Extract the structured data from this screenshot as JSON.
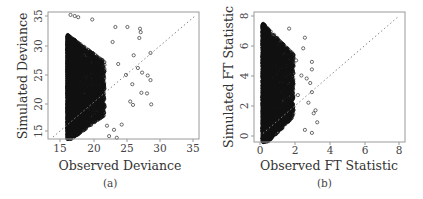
{
  "chart_data": [
    {
      "type": "scatter",
      "panel": "(a)",
      "title": "",
      "xlabel": "Observed Deviance",
      "ylabel": "Simulated Deviance",
      "xlim": [
        14,
        35.5
      ],
      "ylim": [
        13.5,
        35.5
      ],
      "xticks": [
        15,
        20,
        25,
        30,
        35
      ],
      "yticks": [
        15,
        20,
        25,
        30,
        35
      ],
      "grid": false,
      "reference_line": "y = x (dotted)",
      "marker": "open circle",
      "description": "Dense cloud starting at observed ≈16.8, spanning simulated ≈14–33; sparse points extend to observed ≈29",
      "points_sample": [
        [
          17.2,
          35.0
        ],
        [
          17.8,
          34.8
        ],
        [
          18.3,
          34.6
        ],
        [
          20.3,
          34.2
        ],
        [
          23.6,
          32.9
        ],
        [
          25.3,
          32.9
        ],
        [
          27.1,
          32.6
        ],
        [
          27.2,
          32.0
        ],
        [
          27.0,
          31.0
        ],
        [
          23.2,
          30.3
        ],
        [
          26.2,
          28.0
        ],
        [
          28.6,
          28.4
        ],
        [
          24.0,
          26.5
        ],
        [
          26.8,
          25.8
        ],
        [
          27.4,
          25.0
        ],
        [
          28.2,
          24.5
        ],
        [
          28.6,
          23.7
        ],
        [
          25.1,
          24.6
        ],
        [
          26.0,
          23.0
        ],
        [
          27.3,
          21.5
        ],
        [
          28.1,
          21.4
        ],
        [
          28.7,
          19.5
        ],
        [
          26.1,
          19.4
        ],
        [
          25.7,
          20.0
        ],
        [
          24.5,
          16.0
        ],
        [
          23.4,
          15.1
        ],
        [
          22.7,
          14.0
        ],
        [
          23.8,
          13.7
        ],
        [
          22.4,
          15.8
        ],
        [
          21.6,
          17.5
        ]
      ],
      "dense_region": {
        "x_range": [
          16.8,
          21.0
        ],
        "y_range": [
          14.5,
          33.0
        ]
      }
    },
    {
      "type": "scatter",
      "panel": "(b)",
      "title": "",
      "xlabel": "Observed FT Statistic",
      "ylabel": "Simulated FT Statistic",
      "xlim": [
        -0.3,
        8.3
      ],
      "ylim": [
        -0.3,
        8.3
      ],
      "xticks": [
        0,
        2,
        4,
        6,
        8
      ],
      "yticks": [
        0,
        2,
        4,
        6,
        8
      ],
      "grid": false,
      "reference_line": "y = x (dotted)",
      "marker": "open circle",
      "description": "Dense cloud starting at observed ≈0.2, spanning simulated 0–8.3; sparse points extend to observed ≈3.3",
      "points_sample": [
        [
          1.7,
          7.2
        ],
        [
          2.6,
          6.6
        ],
        [
          2.5,
          5.9
        ],
        [
          2.1,
          5.1
        ],
        [
          3.0,
          5.0
        ],
        [
          3.0,
          4.5
        ],
        [
          2.4,
          4.1
        ],
        [
          2.7,
          3.9
        ],
        [
          2.9,
          3.6
        ],
        [
          3.0,
          3.0
        ],
        [
          3.2,
          1.8
        ],
        [
          3.1,
          1.6
        ],
        [
          3.3,
          1.0
        ],
        [
          3.0,
          0.3
        ],
        [
          2.6,
          0.5
        ],
        [
          2.8,
          2.3
        ],
        [
          2.2,
          2.8
        ],
        [
          1.9,
          3.3
        ]
      ],
      "dense_region": {
        "x_range": [
          0.2,
          1.6
        ],
        "y_range": [
          0.0,
          8.2
        ]
      }
    }
  ],
  "panels": {
    "a": {
      "caption": "(a)",
      "xlabel": "Observed Deviance",
      "ylabel": "Simulated Deviance",
      "xticks": [
        "15",
        "20",
        "25",
        "30",
        "35"
      ],
      "yticks": [
        "15",
        "20",
        "25",
        "30",
        "35"
      ]
    },
    "b": {
      "caption": "(b)",
      "xlabel": "Observed FT Statistic",
      "ylabel": "Simulated FT Statistic",
      "xticks": [
        "0",
        "2",
        "4",
        "6",
        "8"
      ],
      "yticks": [
        "0",
        "2",
        "4",
        "6",
        "8"
      ]
    }
  },
  "colors": {
    "frame": "#9a9a9a",
    "points": "#111111",
    "refline": "#888888",
    "text": "#333333"
  }
}
